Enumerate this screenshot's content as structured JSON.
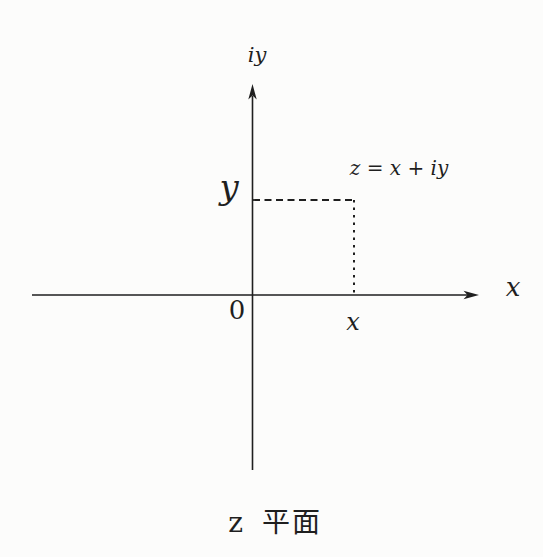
{
  "figure": {
    "caption": "z 平面",
    "axis_labels": {
      "vertical": "iy",
      "horizontal": "x"
    },
    "point": {
      "equation_label": "z = x + iy",
      "x_label": "x",
      "y_label": "y"
    },
    "origin_label": "0",
    "colors": {
      "ink": "#1f1f1f",
      "background": "#fcfcfb"
    }
  }
}
